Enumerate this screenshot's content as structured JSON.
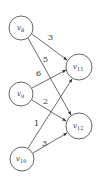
{
  "diagram": {
    "type": "bipartite-directed-graph",
    "nodes": [
      {
        "id": "v8",
        "base": "v",
        "sub": "8",
        "cx": 21,
        "cy": 28,
        "r": 12
      },
      {
        "id": "v9",
        "base": "v",
        "sub": "9",
        "cx": 21,
        "cy": 94,
        "r": 12
      },
      {
        "id": "v10",
        "base": "v",
        "sub": "10",
        "cx": 22,
        "cy": 159,
        "r": 12
      },
      {
        "id": "v11",
        "base": "v",
        "sub": "11",
        "cx": 79,
        "cy": 67,
        "r": 13
      },
      {
        "id": "v12",
        "base": "v",
        "sub": "12",
        "cx": 79,
        "cy": 126,
        "r": 13
      }
    ],
    "edges": [
      {
        "from": "v8",
        "to": "v11",
        "weight": "3",
        "lx": 49,
        "ly": 37
      },
      {
        "from": "v8",
        "to": "v12",
        "weight": "5",
        "lx": 43,
        "ly": 61
      },
      {
        "from": "v9",
        "to": "v11",
        "weight": "6",
        "lx": 38,
        "ly": 73
      },
      {
        "from": "v9",
        "to": "v12",
        "weight": "2",
        "lx": 45,
        "ly": 103
      },
      {
        "from": "v10",
        "to": "v11",
        "weight": "1",
        "lx": 36,
        "ly": 124
      },
      {
        "from": "v10",
        "to": "v12",
        "weight": "3",
        "lx": 44,
        "ly": 147
      }
    ],
    "colors": {
      "stroke": "#444444",
      "fill": "#ffffff",
      "text": "#333333"
    }
  }
}
